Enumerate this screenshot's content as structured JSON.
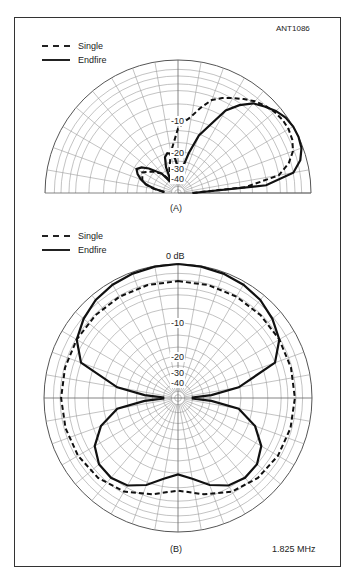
{
  "figure_id": "ANT1086",
  "frequency_label": "1.825 MHz",
  "colors": {
    "line": "#111111",
    "grid": "#9a9a9a",
    "frame": "#333333"
  },
  "chart_data": [
    {
      "type": "polar",
      "panel": "(A)",
      "subtype": "elevation pattern (half-plane, 0°–180°)",
      "legend": [
        {
          "name": "Single",
          "style": "dashed"
        },
        {
          "name": "Endfire",
          "style": "solid"
        }
      ],
      "radial_scale": "ARRL log-periodic dB",
      "tick_labels": [
        "-10",
        "-20",
        "-30",
        "-40"
      ],
      "angle_range_deg": [
        0,
        180
      ],
      "spoke_step_deg": 10,
      "series": [
        {
          "name": "Single",
          "angles_deg": [
            0,
            5,
            10,
            15,
            20,
            25,
            30,
            35,
            40,
            45,
            50,
            55,
            60,
            65,
            70,
            75,
            80,
            85,
            90,
            100,
            110,
            120,
            130,
            140,
            150,
            160,
            165,
            170,
            175,
            180
          ],
          "db": [
            -40,
            -12,
            -6,
            -3.5,
            -2,
            -1.3,
            -1,
            -1,
            -1.3,
            -1.8,
            -2.5,
            -3.5,
            -4.5,
            -5.5,
            -6.5,
            -8,
            -9.5,
            -11,
            -13,
            -20,
            -30,
            -40,
            -30,
            -25,
            -20,
            -22,
            -25,
            -30,
            -40,
            -40
          ]
        },
        {
          "name": "Endfire",
          "angles_deg": [
            0,
            5,
            10,
            15,
            20,
            25,
            30,
            35,
            40,
            45,
            50,
            55,
            60,
            65,
            70,
            75,
            80,
            85,
            90,
            95,
            100,
            105,
            110,
            115,
            120,
            125,
            130,
            140,
            145,
            150,
            155,
            160,
            165,
            170,
            175,
            180
          ],
          "db": [
            -40,
            -8,
            -3,
            -1.2,
            -0.3,
            0,
            0,
            -0.3,
            -1,
            -2,
            -3,
            -5,
            -7,
            -10,
            -14,
            -20,
            -30,
            -40,
            -30,
            -24,
            -21,
            -20,
            -22,
            -28,
            -40,
            -40,
            -30,
            -22,
            -19,
            -18,
            -19,
            -21,
            -25,
            -32,
            -40,
            -40
          ]
        }
      ]
    },
    {
      "type": "polar",
      "panel": "(B)",
      "subtype": "azimuth pattern (full circle)",
      "legend": [
        {
          "name": "Single",
          "style": "dashed"
        },
        {
          "name": "Endfire",
          "style": "solid"
        }
      ],
      "radial_scale": "ARRL log-periodic dB",
      "tick_labels": [
        "0 dB",
        "-10",
        "-20",
        "-30",
        "-40"
      ],
      "angle_range_deg": [
        0,
        360
      ],
      "spoke_step_deg": 10,
      "series": [
        {
          "name": "Single",
          "angles_deg": [
            0,
            15,
            30,
            45,
            60,
            75,
            90,
            105,
            120,
            135,
            150,
            165,
            180,
            195,
            210,
            225,
            240,
            255,
            270,
            285,
            300,
            315,
            330,
            345,
            360
          ],
          "db": [
            -3.2,
            -3.2,
            -3.2,
            -3.2,
            -3.2,
            -3.2,
            -3.2,
            -3.3,
            -3.5,
            -4,
            -5,
            -6.5,
            -7.5,
            -6.5,
            -5,
            -4,
            -3.5,
            -3.3,
            -3.2,
            -3.2,
            -3.2,
            -3.2,
            -3.2,
            -3.2,
            -3.2
          ]
        },
        {
          "name": "Endfire",
          "angles_deg": [
            0,
            10,
            20,
            30,
            40,
            50,
            60,
            70,
            80,
            85,
            88,
            90,
            92,
            95,
            100,
            110,
            120,
            130,
            140,
            150,
            160,
            170,
            180,
            190,
            200,
            210,
            220,
            230,
            240,
            250,
            260,
            265,
            268,
            270,
            272,
            275,
            280,
            290,
            300,
            310,
            320,
            330,
            340,
            350,
            360
          ],
          "db": [
            0,
            -0.1,
            -0.3,
            -0.6,
            -1.1,
            -2,
            -3.2,
            -6,
            -14,
            -25,
            -40,
            -40,
            -40,
            -25,
            -14,
            -9,
            -7,
            -6,
            -5.8,
            -6.3,
            -7.5,
            -9,
            -9.8,
            -9,
            -7.5,
            -6.3,
            -5.8,
            -6,
            -7,
            -9,
            -14,
            -25,
            -40,
            -40,
            -40,
            -25,
            -14,
            -6,
            -3.2,
            -2,
            -1.1,
            -0.6,
            -0.3,
            -0.1,
            0
          ]
        }
      ]
    }
  ],
  "panels": {
    "a": {
      "caption": "(A)",
      "legend_single": "Single",
      "legend_endfire": "Endfire",
      "label_10": "-10",
      "label_20": "-20",
      "label_30": "-30",
      "label_40": "-40"
    },
    "b": {
      "caption": "(B)",
      "legend_single": "Single",
      "legend_endfire": "Endfire",
      "label_0": "0 dB",
      "label_10": "-10",
      "label_20": "-20",
      "label_30": "-30",
      "label_40": "-40"
    }
  }
}
